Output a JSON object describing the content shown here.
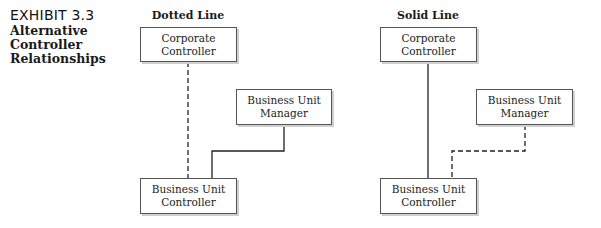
{
  "exhibit": {
    "number": "EXHIBIT 3.3",
    "title": "Alternative Controller Relationships"
  },
  "panels": [
    {
      "title": "Dotted Line",
      "boxes": {
        "top": [
          "Corporate",
          "Controller"
        ],
        "manager": [
          "Business Unit",
          "Manager"
        ],
        "bottom": [
          "Business Unit",
          "Controller"
        ]
      },
      "corporate_link_style": "dashed",
      "manager_link_style": "solid"
    },
    {
      "title": "Solid Line",
      "boxes": {
        "top": [
          "Corporate",
          "Controller"
        ],
        "manager": [
          "Business Unit",
          "Manager"
        ],
        "bottom": [
          "Business Unit",
          "Controller"
        ]
      },
      "corporate_link_style": "solid",
      "manager_link_style": "dashed"
    }
  ]
}
